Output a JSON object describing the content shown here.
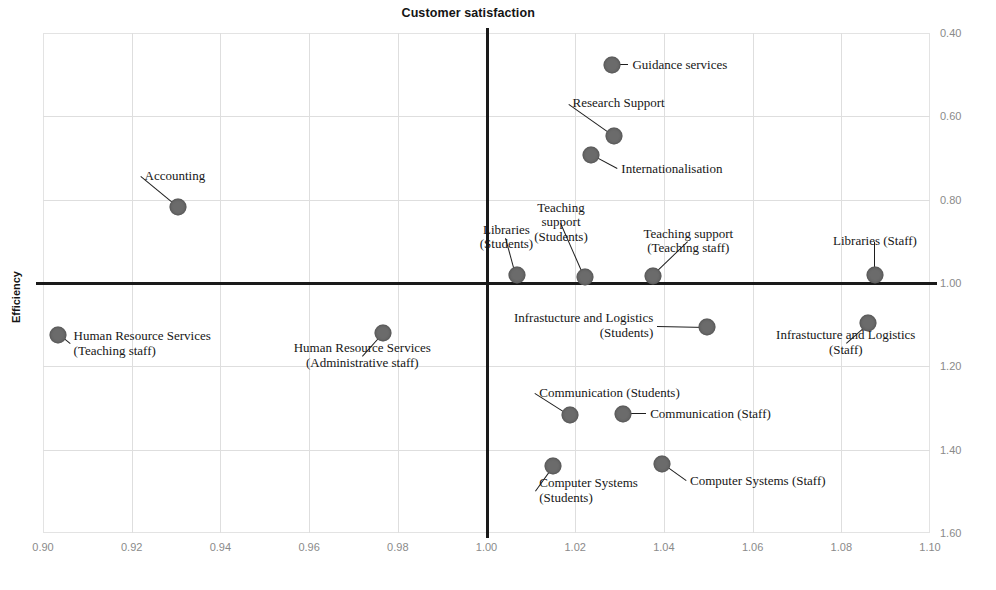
{
  "chart_data": {
    "type": "scatter",
    "title": "Customer satisfaction",
    "xlabel": "Customer satisfaction",
    "ylabel": "Efficiency",
    "xlim": [
      0.9,
      1.1
    ],
    "ylim": [
      1.6,
      0.4
    ],
    "y_axis_inverted": true,
    "y_axis_side": "right",
    "grid": true,
    "xticks": [
      "0.90",
      "0.92",
      "0.94",
      "0.96",
      "0.98",
      "1.00",
      "1.02",
      "1.04",
      "1.06",
      "1.08",
      "1.10"
    ],
    "xtick_values": [
      0.9,
      0.92,
      0.94,
      0.96,
      0.98,
      1.0,
      1.02,
      1.04,
      1.06,
      1.08,
      1.1
    ],
    "yticks": [
      "0.40",
      "0.60",
      "0.80",
      "1.00",
      "1.20",
      "1.40",
      "1.60"
    ],
    "ytick_values": [
      0.4,
      0.6,
      0.8,
      1.0,
      1.2,
      1.4,
      1.6
    ],
    "reference_lines": {
      "x": 1.0,
      "y": 1.0
    },
    "marker_color": "#6b6b6b",
    "points": [
      {
        "label": "Guidance services",
        "x": 1.0283,
        "y": 0.4768,
        "lx": 1.032,
        "ly": 0.4768,
        "align": "left"
      },
      {
        "label": "Research Support",
        "x": 1.0288,
        "y": 0.6472,
        "lx": 1.0185,
        "ly": 0.57,
        "align": "left"
      },
      {
        "label": "Internationalisation",
        "x": 1.0236,
        "y": 0.6928,
        "lx": 1.0295,
        "ly": 0.7264,
        "align": "left"
      },
      {
        "label": "Accounting",
        "x": 0.9304,
        "y": 0.8176,
        "lx": 0.922,
        "ly": 0.744,
        "align": "left"
      },
      {
        "label": "Libraries\n(Students)",
        "x": 1.0068,
        "y": 0.9808,
        "lx": 1.0045,
        "ly": 0.891,
        "align": "center"
      },
      {
        "label": "Teaching\nsupport\n(Students)",
        "x": 1.0221,
        "y": 0.9856,
        "lx": 1.0168,
        "ly": 0.857,
        "align": "center"
      },
      {
        "label": "Teaching support\n(Teaching staff)",
        "x": 1.0375,
        "y": 0.9832,
        "lx": 1.0455,
        "ly": 0.901,
        "align": "center"
      },
      {
        "label": "Libraries (Staff)",
        "x": 1.0876,
        "y": 0.9808,
        "lx": 1.0876,
        "ly": 0.901,
        "align": "center"
      },
      {
        "label": "Human Resource Services\n(Teaching staff)",
        "x": 0.9034,
        "y": 1.1248,
        "lx": 0.906,
        "ly": 1.147,
        "align": "left"
      },
      {
        "label": "Human Resource Services\n(Administrative staff)",
        "x": 0.9767,
        "y": 1.12,
        "lx": 0.972,
        "ly": 1.176,
        "align": "center"
      },
      {
        "label": "Infrastucture and Logistics\n(Students)",
        "x": 1.0497,
        "y": 1.1056,
        "lx": 1.0385,
        "ly": 1.1032,
        "align": "right"
      },
      {
        "label": "Infrastucture and Logistics\n(Staff)",
        "x": 1.0861,
        "y": 1.096,
        "lx": 1.081,
        "ly": 1.144,
        "align": "center"
      },
      {
        "label": "Communication (Students)",
        "x": 1.0188,
        "y": 1.3168,
        "lx": 1.011,
        "ly": 1.264,
        "align": "left"
      },
      {
        "label": "Communication (Staff)",
        "x": 1.0308,
        "y": 1.3144,
        "lx": 1.036,
        "ly": 1.3144,
        "align": "left"
      },
      {
        "label": "Computer Systems\n(Students)",
        "x": 1.0151,
        "y": 1.4392,
        "lx": 1.011,
        "ly": 1.5,
        "align": "left"
      },
      {
        "label": "Computer Systems (Staff)",
        "x": 1.0395,
        "y": 1.4344,
        "lx": 1.045,
        "ly": 1.476,
        "align": "left"
      }
    ]
  },
  "caption": ""
}
